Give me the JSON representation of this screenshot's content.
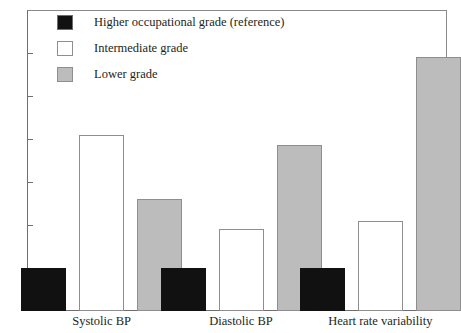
{
  "chart_data": {
    "type": "bar",
    "title": "",
    "subtitle": "",
    "xlabel": "",
    "ylabel": "",
    "categories": [
      "Systolic BP",
      "Diastolic BP",
      "Heart rate variability"
    ],
    "series": [
      {
        "name": "Higher occupational grade (reference)",
        "color": "#111111",
        "values": [
          1.0,
          1.0,
          1.0
        ]
      },
      {
        "name": "Intermediate grade",
        "color": "#ffffff",
        "values": [
          4.1,
          1.9,
          2.1
        ]
      },
      {
        "name": "Lower grade",
        "color": "#bcbcbc",
        "values": [
          2.6,
          3.85,
          5.9
        ]
      }
    ],
    "ylim": [
      0,
      7
    ],
    "yticks": [
      0,
      1,
      2,
      3,
      4,
      5,
      6,
      7
    ],
    "ytick_labels": [
      "0",
      "1",
      "2",
      "3",
      "4",
      "5",
      "6",
      "7"
    ],
    "grid": false,
    "legend_position": "top-left",
    "legend_entries": [
      "Higher occupational grade (reference)",
      "Intermediate grade",
      "Lower grade"
    ]
  },
  "legend": {
    "items": [
      {
        "label": "Higher occupational grade (reference)",
        "swatch": "black-square-icon"
      },
      {
        "label": "Intermediate grade",
        "swatch": "white-square-icon"
      },
      {
        "label": "Lower grade",
        "swatch": "gray-square-icon"
      }
    ]
  },
  "axes": {
    "y_tick_labels": [
      "7",
      "6",
      "5",
      "4",
      "3",
      "2",
      "1",
      "0"
    ],
    "x_tick_labels": [
      "Systolic BP",
      "Diastolic BP",
      "Heart rate variability"
    ]
  },
  "colors": {
    "series_0": "#111111",
    "series_1": "#ffffff",
    "series_2": "#bcbcbc",
    "axis": "#6e6e6e",
    "frame": "#8a8a8a",
    "text": "#231f20",
    "background": "#ffffff"
  }
}
